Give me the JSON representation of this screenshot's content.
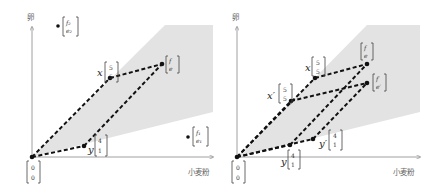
{
  "colors": {
    "cone": "#e3e3e3",
    "axis": "#888888",
    "dash": "#111111"
  },
  "left": {
    "y_axis_label": "卵",
    "x_axis_label": "小麦粉",
    "origin": {
      "top": "0",
      "bottom": "0"
    },
    "x": {
      "name": "x",
      "top": "5",
      "bottom": "5"
    },
    "y": {
      "name": "y",
      "top": "4",
      "bottom": "1"
    },
    "f": {
      "top": "f",
      "bottom": "e"
    },
    "p1": {
      "top": "f₁",
      "bottom": "e₁"
    },
    "p2": {
      "top": "f₂",
      "bottom": "e₂"
    }
  },
  "right": {
    "y_axis_label": "卵",
    "x_axis_label": "小麦粉",
    "origin": {
      "top": "0",
      "bottom": "0"
    },
    "x": {
      "name": "x",
      "top": "5",
      "bottom": "5"
    },
    "xp": {
      "name": "x′",
      "top": "5",
      "bottom": "5"
    },
    "y": {
      "name": "y",
      "top": "4",
      "bottom": "1"
    },
    "yp": {
      "name": "y′",
      "top": "4",
      "bottom": "1"
    },
    "f": {
      "top": "f",
      "bottom": "e"
    },
    "fp": {
      "top": "f′",
      "bottom": "e′"
    }
  }
}
